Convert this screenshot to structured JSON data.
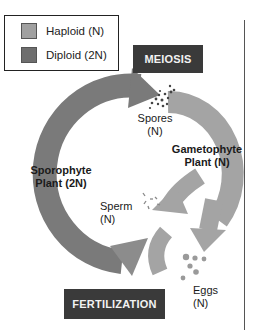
{
  "legend": {
    "items": [
      {
        "label": "Haploid (N)",
        "color": "#a0a0a0"
      },
      {
        "label": "Diploid (2N)",
        "color": "#6e6e6e"
      }
    ]
  },
  "stages": {
    "meiosis": "MEIOSIS",
    "fertilization": "FERTILIZATION"
  },
  "labels": {
    "spores_line1": "Spores",
    "spores_line2": "(N)",
    "gametophyte_line1": "Gametophyte",
    "gametophyte_line2": "Plant (N)",
    "sporophyte_line1": "Sporophyte",
    "sporophyte_line2": "Plant (2N)",
    "sperm_line1": "Sperm",
    "sperm_line2": "(N)",
    "eggs_line1": "Eggs",
    "eggs_line2": "(N)"
  },
  "colors": {
    "haploid_arrow": "#a4a4a4",
    "diploid_arrow": "#7a7a7a",
    "banner_bg": "#3a3a3a",
    "banner_text": "#f2f2f2"
  }
}
